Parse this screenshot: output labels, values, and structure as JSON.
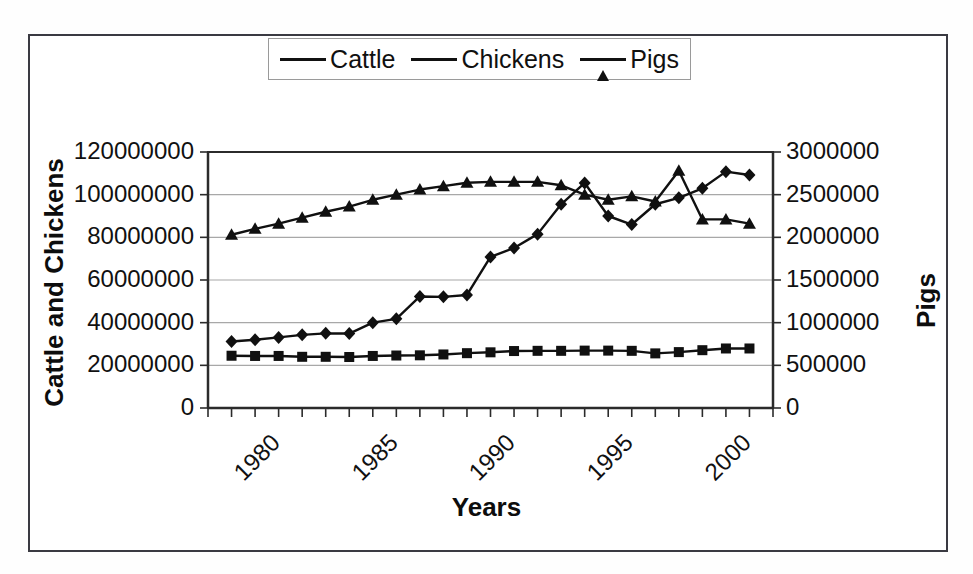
{
  "chart_data": {
    "type": "line",
    "title": "",
    "xlabel": "Years",
    "ylabel": "Cattle and Chickens",
    "ylabel_secondary": "Pigs",
    "grid": true,
    "legend_position": "top",
    "x": [
      1981,
      1982,
      1983,
      1984,
      1985,
      1986,
      1987,
      1988,
      1989,
      1990,
      1991,
      1992,
      1993,
      1994,
      1995,
      1996,
      1997,
      1998,
      1999,
      2000,
      2001,
      2002,
      2003
    ],
    "xlim": [
      1980,
      2004
    ],
    "xticks": [
      1980,
      1985,
      1990,
      1995,
      2000
    ],
    "xtick_labels": [
      "1980",
      "1985",
      "1990",
      "1995",
      "2000"
    ],
    "ylim": [
      0,
      120000000
    ],
    "yticks": [
      0,
      20000000,
      40000000,
      60000000,
      80000000,
      100000000,
      120000000
    ],
    "ytick_labels": [
      "0",
      "20000000",
      "40000000",
      "60000000",
      "80000000",
      "100000000",
      "120000000"
    ],
    "ylim_secondary": [
      0,
      3000000
    ],
    "yticks_secondary": [
      0,
      500000,
      1000000,
      1500000,
      2000000,
      2500000,
      3000000
    ],
    "ytick_labels_secondary": [
      "0",
      "500000",
      "1000000",
      "1500000",
      "2000000",
      "2500000",
      "3000000"
    ],
    "series": [
      {
        "name": "Cattle",
        "axis": "left",
        "marker": "square",
        "color": "#101010",
        "values": [
          24500000,
          24400000,
          24400000,
          24000000,
          24000000,
          23900000,
          24400000,
          24600000,
          24700000,
          25100000,
          25700000,
          26100000,
          26700000,
          26800000,
          26800000,
          26900000,
          26900000,
          26800000,
          25600000,
          26200000,
          27100000,
          27900000,
          27900000
        ]
      },
      {
        "name": "Chickens",
        "axis": "left",
        "marker": "diamond",
        "color": "#101010",
        "values": [
          31200000,
          32000000,
          33100000,
          34300000,
          35000000,
          34900000,
          40000000,
          41800000,
          52300000,
          52100000,
          53000000,
          70800000,
          75000000,
          81500000,
          95500000,
          105500000,
          90000000,
          86000000,
          95500000,
          98500000,
          103000000,
          110800000,
          109200000
        ]
      },
      {
        "name": "Pigs",
        "axis": "right",
        "marker": "triangle",
        "color": "#101010",
        "values": [
          2030000,
          2100000,
          2160000,
          2230000,
          2300000,
          2360000,
          2440000,
          2500000,
          2560000,
          2600000,
          2640000,
          2650000,
          2650000,
          2650000,
          2610000,
          2500000,
          2440000,
          2480000,
          2420000,
          2780000,
          2210000,
          2210000,
          2160000
        ]
      }
    ]
  },
  "legend": {
    "items": [
      {
        "label": "Cattle",
        "marker": "square"
      },
      {
        "label": "Chickens",
        "marker": "diamond"
      },
      {
        "label": "Pigs",
        "marker": "triangle"
      }
    ]
  },
  "axis_titles": {
    "left": "Cattle and Chickens",
    "right": "Pigs",
    "bottom": "Years"
  },
  "colors": {
    "ink": "#101010",
    "frame": "#3a3a42",
    "grid": "#a8a8a8",
    "background": "#ffffff"
  }
}
